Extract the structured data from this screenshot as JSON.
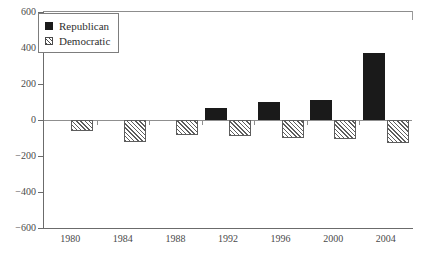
{
  "chart_data": {
    "type": "bar",
    "title": "",
    "subtitle": "",
    "xlabel": "",
    "ylabel": "",
    "categories": [
      "1980",
      "1984",
      "1988",
      "1992",
      "1996",
      "2000",
      "2004"
    ],
    "series": [
      {
        "name": "Republican",
        "swatch": "solid-black",
        "color": "#1a1a1a",
        "values": [
          0,
          0,
          0,
          65,
          100,
          110,
          375
        ]
      },
      {
        "name": "Democratic",
        "swatch": "diagonal-hatch",
        "color": "#5d5d5d",
        "values": [
          -60,
          -120,
          -85,
          -90,
          -100,
          -105,
          -130
        ]
      }
    ],
    "ylim": [
      -600,
      600
    ],
    "yticks": [
      600,
      400,
      200,
      0,
      -200,
      -400,
      -600
    ],
    "ytick_labels": [
      "600",
      "400",
      "200",
      "0",
      "−200",
      "−400",
      "−600"
    ],
    "grid": false,
    "zero_line": true,
    "legend_position": "top-left"
  },
  "legend": {
    "items": [
      {
        "label": "Republican"
      },
      {
        "label": "Democratic"
      }
    ]
  }
}
